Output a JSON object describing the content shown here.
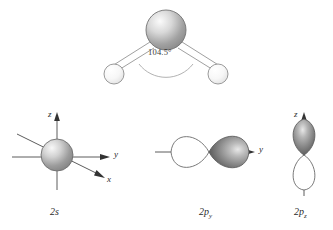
{
  "figure": {
    "title": "",
    "background_color": "#ffffff"
  },
  "molecule": {
    "name": "water-molecule",
    "bond_angle_label": "104.5°",
    "central_atom": {
      "element_name": "oxygen-sphere",
      "fill_light": "#f2f2f2",
      "fill_dark": "#8d8d8d",
      "outline": "#6e6e6e",
      "cx": 166,
      "cy": 30,
      "r": 20
    },
    "terminal_atoms": [
      {
        "element_name": "hydrogen-sphere-left",
        "fill_light": "#ffffff",
        "fill_dark": "#dcdcdc",
        "outline": "#8a8a8a",
        "cx": 114,
        "cy": 74,
        "r": 10
      },
      {
        "element_name": "hydrogen-sphere-right",
        "fill_light": "#ffffff",
        "fill_dark": "#dcdcdc",
        "outline": "#8a8a8a",
        "cx": 218,
        "cy": 74,
        "r": 10
      }
    ],
    "bond_style": "double-line",
    "bond_color": "#9a9a9a"
  },
  "orbitals": [
    {
      "id": "orbital-2s",
      "caption_main": "2",
      "caption_sub": "s",
      "caption_full": "2s",
      "type": "s",
      "shape": "sphere",
      "sphere_fill_light": "#efefef",
      "sphere_fill_dark": "#8b8b8b",
      "sphere_outline": "#707070",
      "axes": [
        {
          "name": "axis-z",
          "label": "z",
          "direction": "up"
        },
        {
          "name": "axis-y",
          "label": "y",
          "direction": "right"
        },
        {
          "name": "axis-x",
          "label": "x",
          "direction": "lower-right"
        }
      ]
    },
    {
      "id": "orbital-2py",
      "caption_main": "2p",
      "caption_sub": "y",
      "caption_full": "2py",
      "type": "p",
      "shape": "dumbbell",
      "orientation": "horizontal",
      "lobe_filled": "right",
      "lobe_fill_light": "#f4f4f4",
      "lobe_fill_dark": "#5f5f5f",
      "lobe_outline": "#6b6b6b",
      "axes": [
        {
          "name": "axis-y",
          "label": "y",
          "direction": "right"
        }
      ]
    },
    {
      "id": "orbital-2pz",
      "caption_main": "2p",
      "caption_sub": "z",
      "caption_full": "2pz",
      "type": "p",
      "shape": "dumbbell",
      "orientation": "vertical",
      "lobe_filled": "top",
      "lobe_fill_light": "#f4f4f4",
      "lobe_fill_dark": "#5f5f5f",
      "lobe_outline": "#6b6b6b",
      "axes": [
        {
          "name": "axis-z",
          "label": "z",
          "direction": "up"
        }
      ]
    }
  ]
}
